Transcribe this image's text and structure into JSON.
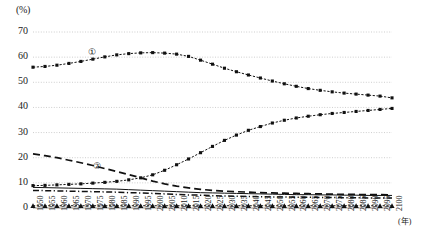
{
  "chart_data": {
    "type": "line",
    "title": "",
    "xlabel": "(年)",
    "ylabel": "(%)",
    "ylim": [
      0,
      70
    ],
    "ytick_labels": [
      "0",
      "10",
      "20",
      "30",
      "40",
      "50",
      "60",
      "70"
    ],
    "ytick_values": [
      0,
      10,
      20,
      30,
      40,
      50,
      60,
      70
    ],
    "grid": true,
    "legend_position": "inline-annotation",
    "x": [
      1950,
      1955,
      1960,
      1965,
      1970,
      1975,
      1980,
      1985,
      1990,
      1995,
      2000,
      2005,
      2010,
      2015,
      2020,
      2025,
      2030,
      2035,
      2040,
      2045,
      2050,
      2055,
      2060,
      2065,
      2070,
      2075,
      2080,
      2085,
      2090,
      2095,
      2100
    ],
    "categories": [
      "1950",
      "1955",
      "1960",
      "1965",
      "1970",
      "1975",
      "1980",
      "1985",
      "1990",
      "1995",
      "2000",
      "2005",
      "2010",
      "2015",
      "2020",
      "2025",
      "2030",
      "2035",
      "2040",
      "2045",
      "2050",
      "2055",
      "2060",
      "2065",
      "2070",
      "2075",
      "2080",
      "2085",
      "2090",
      "2095",
      "2100"
    ],
    "annotations": [
      {
        "text": "①",
        "x_px": 88,
        "y_px": 47
      },
      {
        "text": "②",
        "x_px": 93,
        "y_px": 161
      }
    ],
    "series": [
      {
        "name": "①",
        "marker": "square",
        "style": "solid-marker",
        "color": "#111111",
        "values": [
          56.0,
          56.3,
          56.8,
          57.5,
          58.3,
          59.2,
          60.1,
          60.9,
          61.4,
          61.7,
          61.8,
          61.6,
          61.2,
          60.3,
          58.8,
          57.2,
          55.6,
          54.2,
          52.9,
          51.7,
          50.5,
          49.4,
          48.4,
          47.5,
          46.8,
          46.2,
          45.7,
          45.3,
          44.9,
          44.5,
          43.8
        ]
      },
      {
        "name": "②",
        "marker": "none",
        "style": "dashed",
        "color": "#111111",
        "values": [
          21.5,
          20.8,
          20.0,
          19.0,
          18.0,
          16.9,
          15.7,
          14.5,
          13.3,
          12.0,
          10.7,
          9.6,
          8.7,
          8.0,
          7.4,
          7.0,
          6.7,
          6.5,
          6.3,
          6.1,
          6.0,
          5.9,
          5.8,
          5.7,
          5.6,
          5.5,
          5.4,
          5.4,
          5.3,
          5.3,
          5.2
        ]
      },
      {
        "name": "rising-series",
        "marker": "square",
        "style": "solid-marker",
        "color": "#111111",
        "values": [
          8.9,
          9.0,
          9.2,
          9.4,
          9.6,
          9.9,
          10.2,
          10.6,
          11.2,
          12.0,
          13.2,
          15.0,
          17.2,
          19.5,
          22.0,
          24.5,
          26.9,
          29.0,
          30.9,
          32.4,
          33.8,
          34.9,
          35.8,
          36.5,
          37.1,
          37.6,
          38.0,
          38.4,
          38.8,
          39.2,
          39.6
        ]
      },
      {
        "name": "thin-solid-series",
        "marker": "none",
        "style": "thin-solid",
        "color": "#111111",
        "values": [
          8.2,
          8.1,
          8.0,
          7.9,
          7.8,
          7.7,
          7.6,
          7.5,
          7.3,
          7.1,
          6.9,
          6.7,
          6.5,
          6.3,
          6.1,
          6.0,
          5.9,
          5.8,
          5.7,
          5.6,
          5.5,
          5.4,
          5.3,
          5.3,
          5.2,
          5.2,
          5.1,
          5.1,
          5.0,
          5.0,
          5.0
        ]
      },
      {
        "name": "dash-dot-series",
        "marker": "none",
        "style": "dash-dot",
        "color": "#111111",
        "values": [
          7.0,
          6.9,
          6.8,
          6.7,
          6.6,
          6.5,
          6.4,
          6.3,
          6.1,
          6.0,
          5.8,
          5.6,
          5.4,
          5.2,
          5.1,
          4.9,
          4.8,
          4.7,
          4.6,
          4.5,
          4.4,
          4.4,
          4.3,
          4.3,
          4.2,
          4.2,
          4.1,
          4.1,
          4.0,
          4.0,
          4.0
        ]
      },
      {
        "name": "baseline-triangle-series",
        "marker": "triangle",
        "style": "solid-marker",
        "color": "#111111",
        "values": [
          0.9,
          0.9,
          0.9,
          0.9,
          0.9,
          0.9,
          0.9,
          0.9,
          0.9,
          0.9,
          0.9,
          0.9,
          0.9,
          0.9,
          0.9,
          0.9,
          0.9,
          0.9,
          0.9,
          0.9,
          0.9,
          0.9,
          0.9,
          0.9,
          0.9,
          0.9,
          0.9,
          0.9,
          0.9,
          0.9,
          0.9
        ]
      }
    ]
  }
}
